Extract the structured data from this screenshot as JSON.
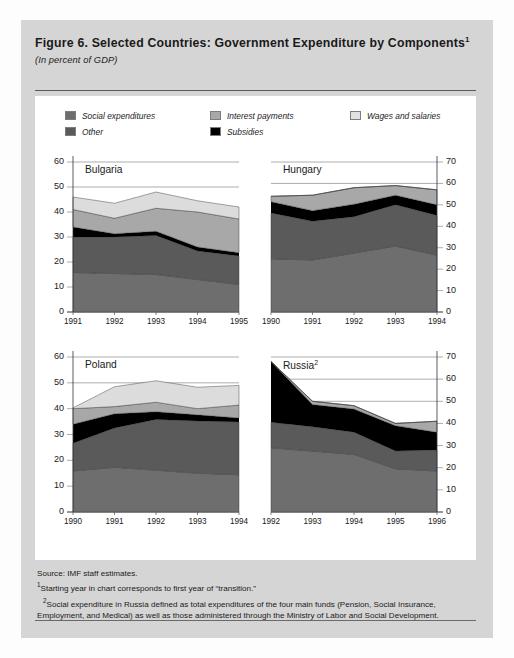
{
  "figure": {
    "title": "Figure 6.  Selected Countries:  Government Expenditure by Components",
    "title_sup": "1",
    "subtitle": "(In percent of GDP)"
  },
  "legend": {
    "items": [
      {
        "label": "Social expenditures",
        "color": "#6e6e6e"
      },
      {
        "label": "Other",
        "color": "#5a5a5a"
      },
      {
        "label": "Interest payments",
        "color": "#a8a8a8"
      },
      {
        "label": "Subsidies",
        "color": "#000000"
      },
      {
        "label": "Wages and salaries",
        "color": "#dcdcdc"
      }
    ]
  },
  "notes": {
    "source": "Source:  IMF staff estimates.",
    "note1_sup": "1",
    "note1": "Starting year in chart corresponds to first year of “transition.”",
    "note2_sup": "2",
    "note2": "Social expenditure in Russia defined as total expenditures of the four main funds (Pension, Social Insurance, Employment, and Medical) as well as those administered through the Ministry of Labor and Social Development."
  },
  "chart_data": [
    {
      "type": "area",
      "title": "Bulgaria",
      "title_sup": "",
      "axis_side": "left",
      "xlabel": "",
      "ylabel": "",
      "ylim": [
        0,
        60
      ],
      "yticks": [
        0,
        10,
        20,
        30,
        40,
        50,
        60
      ],
      "ytick_labels": [
        "0",
        "10",
        "20",
        "30",
        "40",
        "50",
        "60"
      ],
      "grid": true,
      "categories": [
        "1991",
        "1992",
        "1993",
        "1994",
        "1995"
      ],
      "stacked": true,
      "series": [
        {
          "name": "Social expenditures",
          "color": "#6e6e6e",
          "values": [
            15.8,
            15.4,
            15.0,
            13.0,
            11.0
          ]
        },
        {
          "name": "Other",
          "color": "#5a5a5a",
          "values": [
            14.2,
            14.6,
            15.6,
            11.4,
            11.4
          ]
        },
        {
          "name": "Subsidies",
          "color": "#000000",
          "values": [
            4.0,
            1.3,
            1.7,
            1.6,
            1.3
          ]
        },
        {
          "name": "Interest payments",
          "color": "#a8a8a8",
          "values": [
            7.0,
            6.2,
            9.2,
            14.0,
            13.5
          ]
        },
        {
          "name": "Wages and salaries",
          "color": "#dcdcdc",
          "values": [
            5.0,
            6.0,
            6.5,
            4.5,
            4.8
          ]
        }
      ],
      "totals": [
        46.0,
        43.5,
        48.0,
        44.5,
        42.0
      ]
    },
    {
      "type": "area",
      "title": "Hungary",
      "title_sup": "",
      "axis_side": "right",
      "xlabel": "",
      "ylabel": "",
      "ylim": [
        0,
        70
      ],
      "yticks": [
        0,
        10,
        20,
        30,
        40,
        50,
        60,
        70
      ],
      "ytick_labels": [
        "0",
        "10",
        "20",
        "30",
        "40",
        "50",
        "60",
        "70"
      ],
      "grid": true,
      "categories": [
        "1990",
        "1991",
        "1992",
        "1993",
        "1994"
      ],
      "stacked": true,
      "series": [
        {
          "name": "Social expenditures",
          "color": "#6e6e6e",
          "values": [
            24.8,
            24.3,
            27.5,
            30.8,
            26.5
          ]
        },
        {
          "name": "Other",
          "color": "#5a5a5a",
          "values": [
            21.4,
            18.0,
            17.0,
            19.2,
            18.5
          ]
        },
        {
          "name": "Subsidies",
          "color": "#000000",
          "values": [
            5.3,
            5.0,
            5.8,
            4.5,
            5.0
          ]
        },
        {
          "name": "Interest payments",
          "color": "#a8a8a8",
          "values": [
            2.5,
            7.2,
            7.7,
            4.5,
            7.0
          ]
        },
        {
          "name": "Wages and salaries",
          "color": "#dcdcdc",
          "values": [
            0.0,
            0.0,
            0.0,
            0.0,
            0.0
          ]
        }
      ],
      "totals": [
        54.0,
        54.5,
        58.0,
        59.0,
        57.0
      ]
    },
    {
      "type": "area",
      "title": "Poland",
      "title_sup": "",
      "axis_side": "left",
      "xlabel": "",
      "ylabel": "",
      "ylim": [
        0,
        60
      ],
      "yticks": [
        0,
        10,
        20,
        30,
        40,
        50,
        60
      ],
      "ytick_labels": [
        "0",
        "10",
        "20",
        "30",
        "40",
        "50",
        "60"
      ],
      "grid": true,
      "categories": [
        "1990",
        "1991",
        "1992",
        "1993",
        "1994"
      ],
      "stacked": true,
      "series": [
        {
          "name": "Social expenditures",
          "color": "#6e6e6e",
          "values": [
            15.9,
            17.3,
            16.2,
            15.0,
            14.4
          ]
        },
        {
          "name": "Other",
          "color": "#5a5a5a",
          "values": [
            10.7,
            15.2,
            19.6,
            20.2,
            20.4
          ]
        },
        {
          "name": "Subsidies",
          "color": "#000000",
          "values": [
            7.4,
            5.5,
            3.0,
            2.4,
            1.6
          ]
        },
        {
          "name": "Interest payments",
          "color": "#a8a8a8",
          "values": [
            6.0,
            2.8,
            3.7,
            2.4,
            5.0
          ]
        },
        {
          "name": "Wages and salaries",
          "color": "#dcdcdc",
          "values": [
            0.3,
            7.7,
            8.3,
            8.3,
            7.6
          ]
        }
      ],
      "totals": [
        40.3,
        48.5,
        50.8,
        48.3,
        49.0
      ]
    },
    {
      "type": "area",
      "title": "Russia",
      "title_sup": "2",
      "axis_side": "right",
      "xlabel": "",
      "ylabel": "",
      "ylim": [
        0,
        70
      ],
      "yticks": [
        0,
        10,
        20,
        30,
        40,
        50,
        60,
        70
      ],
      "ytick_labels": [
        "0",
        "10",
        "20",
        "30",
        "40",
        "50",
        "60",
        "70"
      ],
      "grid": true,
      "categories": [
        "1992",
        "1993",
        "1994",
        "1995",
        "1996"
      ],
      "stacked": true,
      "series": [
        {
          "name": "Social expenditures",
          "color": "#6e6e6e",
          "values": [
            29.0,
            27.5,
            26.0,
            19.5,
            18.5
          ]
        },
        {
          "name": "Other",
          "color": "#5a5a5a",
          "values": [
            11.5,
            11.0,
            10.0,
            8.0,
            9.5
          ]
        },
        {
          "name": "Subsidies",
          "color": "#000000",
          "values": [
            27.5,
            10.0,
            10.5,
            11.5,
            8.0
          ]
        },
        {
          "name": "Interest payments",
          "color": "#a8a8a8",
          "values": [
            0.0,
            1.5,
            1.5,
            1.0,
            5.0
          ]
        },
        {
          "name": "Wages and salaries",
          "color": "#dcdcdc",
          "values": [
            0.0,
            0.0,
            0.0,
            0.0,
            0.0
          ]
        }
      ],
      "totals": [
        68.0,
        50.0,
        48.0,
        40.0,
        41.0
      ]
    }
  ]
}
